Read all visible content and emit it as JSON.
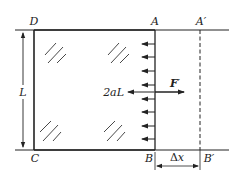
{
  "diagram": {
    "type": "physics-film-frame",
    "colors": {
      "stroke": "#222222",
      "background": "#ffffff"
    },
    "corners": {
      "top_left": "D",
      "top_right": "A",
      "bottom_left": "C",
      "bottom_right": "B"
    },
    "displaced_corners": {
      "top": "A′",
      "bottom": "B′"
    },
    "labels": {
      "height": "L",
      "tension": "2aL",
      "force": "F",
      "force_prime": "′",
      "displacement_delta": "Δ",
      "displacement_var": "x"
    },
    "small_arrows_count": 8,
    "hatch_groups": 4
  }
}
